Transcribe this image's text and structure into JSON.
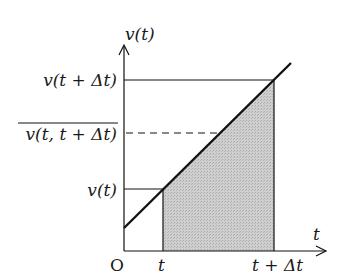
{
  "diagram": {
    "type": "velocity-time graph",
    "y_axis_label": "v(t)",
    "x_axis_label": "t",
    "origin_label": "O",
    "x_ticks": [
      "t",
      "t + Δt"
    ],
    "y_ticks": [
      "v(t + Δt)",
      "v(t, t + Δt)",
      "v(t)"
    ],
    "y_tick_overline": "v(t, t + Δt)",
    "colors": {
      "line": "#111111",
      "shade": "#c8c8c8",
      "background": "#ffffff"
    }
  }
}
